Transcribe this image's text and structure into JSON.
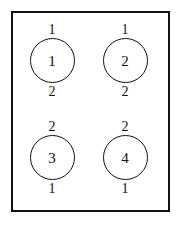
{
  "diagram": {
    "frame": {
      "name": "outer-rectangle",
      "border_color": "#111111",
      "fill_color": "#ffffff"
    },
    "stroke_color": "#111111",
    "background_color": "#ffffff",
    "nodes": [
      {
        "id": "node-1",
        "label_above": "1",
        "center_label": "1",
        "label_below": "2",
        "row": 1,
        "column": 1
      },
      {
        "id": "node-2",
        "label_above": "1",
        "center_label": "2",
        "label_below": "2",
        "row": 1,
        "column": 2
      },
      {
        "id": "node-3",
        "label_above": "2",
        "center_label": "3",
        "label_below": "1",
        "row": 2,
        "column": 1
      },
      {
        "id": "node-4",
        "label_above": "2",
        "center_label": "4",
        "label_below": "1",
        "row": 2,
        "column": 2
      }
    ]
  }
}
